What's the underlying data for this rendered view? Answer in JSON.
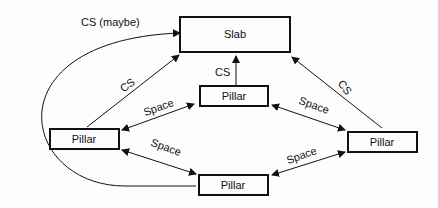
{
  "nodes": {
    "slab": {
      "label": "Slab"
    },
    "pillar_top": {
      "label": "Pillar"
    },
    "pillar_left": {
      "label": "Pillar"
    },
    "pillar_right": {
      "label": "Pillar"
    },
    "pillar_bottom": {
      "label": "Pillar"
    }
  },
  "edges": {
    "cs_maybe": {
      "label": "CS (maybe)"
    },
    "cs_left": {
      "label": "CS"
    },
    "cs_center": {
      "label": "CS"
    },
    "cs_right": {
      "label": "CS"
    },
    "space_top_left": {
      "label": "Space"
    },
    "space_top_right": {
      "label": "Space"
    },
    "space_left_bottom": {
      "label": "Space"
    },
    "space_bottom_right": {
      "label": "Space"
    }
  }
}
